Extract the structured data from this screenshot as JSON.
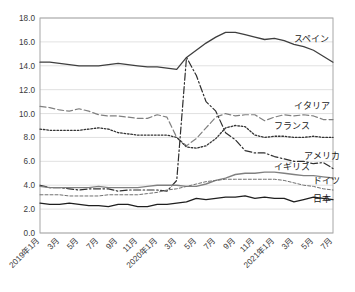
{
  "chart_data": {
    "type": "line",
    "title": "",
    "xlabel": "",
    "ylabel": "",
    "ylim": [
      0.0,
      18.0
    ],
    "ytick_step": 2.0,
    "ytick_labels": [
      "0.0",
      "2.0",
      "4.0",
      "6.0",
      "8.0",
      "10.0",
      "12.0",
      "14.0",
      "16.0",
      "18.0"
    ],
    "grid": "horizontal",
    "legend_position": "inline-right-of-series",
    "x": [
      "2019年1月",
      "2019年2月",
      "2019年3月",
      "2019年4月",
      "2019年5月",
      "2019年6月",
      "2019年7月",
      "2019年8月",
      "2019年9月",
      "2019年10月",
      "2019年11月",
      "2019年12月",
      "2020年1月",
      "2020年2月",
      "2020年3月",
      "2020年4月",
      "2020年5月",
      "2020年6月",
      "2020年7月",
      "2020年8月",
      "2020年9月",
      "2020年10月",
      "2020年11月",
      "2020年12月",
      "2021年1月",
      "2021年2月",
      "2021年3月",
      "2021年4月",
      "2021年5月",
      "2021年6月",
      "2021年7月"
    ],
    "xtick_labels": [
      "2019年1月",
      "3月",
      "5月",
      "7月",
      "9月",
      "11月",
      "2020年1月",
      "3月",
      "5月",
      "7月",
      "9月",
      "11月",
      "2021年1月",
      "3月",
      "5月",
      "7月"
    ],
    "xtick_indices": [
      0,
      2,
      4,
      6,
      8,
      10,
      12,
      14,
      16,
      18,
      20,
      22,
      24,
      26,
      28,
      30
    ],
    "series": [
      {
        "name": "スペイン",
        "label": "スペイン",
        "style": "solid",
        "color": "#3f3f3f",
        "width": 1.3,
        "values": [
          14.3,
          14.3,
          14.2,
          14.1,
          14.0,
          14.0,
          14.0,
          14.1,
          14.2,
          14.1,
          14.0,
          13.9,
          13.9,
          13.8,
          13.7,
          14.7,
          15.3,
          15.9,
          16.4,
          16.8,
          16.8,
          16.6,
          16.4,
          16.2,
          16.3,
          16.1,
          15.8,
          15.6,
          15.3,
          14.8,
          14.3
        ]
      },
      {
        "name": "イタリア",
        "label": "イタリア",
        "style": "dashed",
        "color": "#808080",
        "width": 1.2,
        "values": [
          10.6,
          10.5,
          10.3,
          10.2,
          10.4,
          10.2,
          9.9,
          9.8,
          9.8,
          9.7,
          9.6,
          9.6,
          9.9,
          9.7,
          8.0,
          7.3,
          7.9,
          8.8,
          9.7,
          10.0,
          9.8,
          9.9,
          9.9,
          9.4,
          9.7,
          9.9,
          9.8,
          9.9,
          9.8,
          9.5,
          9.5
        ]
      },
      {
        "name": "フランス",
        "label": "フランス",
        "style": "dotted",
        "color": "#333333",
        "width": 1.3,
        "values": [
          8.7,
          8.6,
          8.6,
          8.6,
          8.6,
          8.7,
          8.8,
          8.7,
          8.4,
          8.3,
          8.2,
          8.2,
          8.2,
          8.2,
          8.0,
          7.2,
          7.1,
          7.3,
          7.9,
          8.8,
          9.0,
          8.9,
          8.2,
          8.0,
          8.1,
          8.1,
          8.0,
          8.0,
          8.1,
          8.0,
          8.0
        ]
      },
      {
        "name": "アメリカ",
        "label": "アメリカ",
        "style": "dashdot",
        "color": "#2e2e2e",
        "width": 1.2,
        "values": [
          4.0,
          3.8,
          3.8,
          3.7,
          3.6,
          3.7,
          3.7,
          3.7,
          3.5,
          3.6,
          3.6,
          3.6,
          3.6,
          3.5,
          4.4,
          14.7,
          13.2,
          11.0,
          10.2,
          8.4,
          7.8,
          6.9,
          6.7,
          6.7,
          6.4,
          6.2,
          6.0,
          6.0,
          5.8,
          5.9,
          5.4
        ]
      },
      {
        "name": "イギリス",
        "label": "イギリス",
        "style": "solid",
        "color": "#808080",
        "width": 1.4,
        "values": [
          3.9,
          3.8,
          3.8,
          3.8,
          3.8,
          3.8,
          3.9,
          3.8,
          3.8,
          3.8,
          3.8,
          3.9,
          4.0,
          4.0,
          4.0,
          3.9,
          3.9,
          4.1,
          4.4,
          4.6,
          4.9,
          5.0,
          5.0,
          5.1,
          5.1,
          5.0,
          4.9,
          4.8,
          4.8,
          4.7,
          4.6
        ]
      },
      {
        "name": "ドイツ",
        "label": "ドイツ",
        "style": "finedash",
        "color": "#707070",
        "width": 1.0,
        "values": [
          3.2,
          3.2,
          3.2,
          3.1,
          3.1,
          3.1,
          3.1,
          3.2,
          3.2,
          3.2,
          3.2,
          3.3,
          3.4,
          3.6,
          3.7,
          3.9,
          4.1,
          4.3,
          4.4,
          4.5,
          4.5,
          4.5,
          4.5,
          4.5,
          4.5,
          4.4,
          4.2,
          4.0,
          3.9,
          3.7,
          3.6
        ]
      },
      {
        "name": "日本",
        "label": "日本",
        "style": "solid",
        "color": "#1f1f1f",
        "width": 1.3,
        "values": [
          2.5,
          2.4,
          2.4,
          2.5,
          2.4,
          2.3,
          2.3,
          2.2,
          2.4,
          2.4,
          2.2,
          2.2,
          2.4,
          2.4,
          2.5,
          2.6,
          2.9,
          2.8,
          2.9,
          3.0,
          3.0,
          3.1,
          2.9,
          3.0,
          2.9,
          2.9,
          2.6,
          2.8,
          3.0,
          2.9,
          2.8
        ]
      }
    ],
    "label_anchors": [
      {
        "series": "スペイン",
        "x_index": 26,
        "value": 16.0
      },
      {
        "series": "イタリア",
        "x_index": 26,
        "value": 10.4
      },
      {
        "series": "フランス",
        "x_index": 24,
        "value": 8.7
      },
      {
        "series": "アメリカ",
        "x_index": 27,
        "value": 6.2
      },
      {
        "series": "イギリス",
        "x_index": 24,
        "value": 5.3
      },
      {
        "series": "ドイツ",
        "x_index": 28,
        "value": 4.1
      },
      {
        "series": "日本",
        "x_index": 28,
        "value": 2.6
      }
    ]
  },
  "plot": {
    "left": 40,
    "top": 18,
    "right": 333,
    "bottom": 233,
    "border_color": "#a6a6a6",
    "grid_color": "#d9d9d9"
  }
}
